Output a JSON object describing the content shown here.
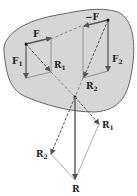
{
  "diagram": {
    "body_color": "#d6d6d6",
    "body_stroke": "#444444",
    "vector_color": "#555555",
    "labels": {
      "F": "F",
      "neg_F": "−F",
      "F1": "F",
      "F1_sub": "1",
      "F2": "F",
      "F2_sub": "2",
      "R1_inside": "R",
      "R1_inside_sub": "1",
      "R2_inside": "R",
      "R2_inside_sub": "2",
      "R1_outside": "R",
      "R1_outside_sub": "1",
      "R2_outside": "R",
      "R2_outside_sub": "2",
      "R": "R"
    }
  }
}
